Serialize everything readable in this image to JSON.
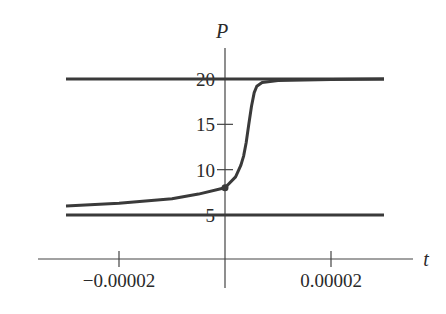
{
  "chart_data": {
    "type": "line",
    "title": "",
    "xlabel": "t",
    "ylabel": "P",
    "xlim": [
      -3e-05,
      3e-05
    ],
    "ylim": [
      0,
      22
    ],
    "x_ticks": [
      -2e-05,
      2e-05
    ],
    "x_tick_labels": [
      "−0.00002",
      "0.00002"
    ],
    "y_ticks": [
      5,
      10,
      15,
      20
    ],
    "y_tick_labels": [
      "5",
      "10",
      "15",
      "20"
    ],
    "grid": false,
    "legend": null,
    "series": [
      {
        "name": "equilibrium P=20",
        "x": [
          -3e-05,
          3e-05
        ],
        "values": [
          20,
          20
        ]
      },
      {
        "name": "equilibrium P=5",
        "x": [
          -3e-05,
          3e-05
        ],
        "values": [
          5,
          5
        ]
      },
      {
        "name": "solution P(t)",
        "x": [
          -3e-05,
          -2e-05,
          -1e-05,
          -5e-06,
          0,
          2e-06,
          3e-06,
          3.5e-06,
          4e-06,
          4.5e-06,
          5e-06,
          5.5e-06,
          6e-06,
          7e-06,
          1e-05,
          2e-05,
          3e-05
        ],
        "values": [
          6.0,
          6.3,
          6.8,
          7.3,
          8.0,
          9.2,
          10.5,
          11.5,
          13.0,
          15.0,
          17.0,
          18.5,
          19.2,
          19.6,
          19.85,
          19.95,
          20.0
        ]
      }
    ],
    "annotations": [
      {
        "type": "point",
        "x": 0,
        "y": 8
      }
    ]
  }
}
